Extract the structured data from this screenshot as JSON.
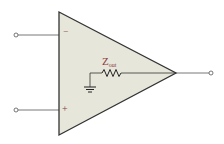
{
  "diagram": {
    "component": "operational-amplifier",
    "inputs": [
      {
        "name": "inverting",
        "symbol": "−"
      },
      {
        "name": "non-inverting",
        "symbol": "+"
      }
    ],
    "resistor_label_main": "Z",
    "resistor_label_sub": "out",
    "colors": {
      "triangle_fill": "#e6e6da",
      "stroke": "#333333",
      "wire": "#555555",
      "label": "#8b3a3a"
    }
  }
}
